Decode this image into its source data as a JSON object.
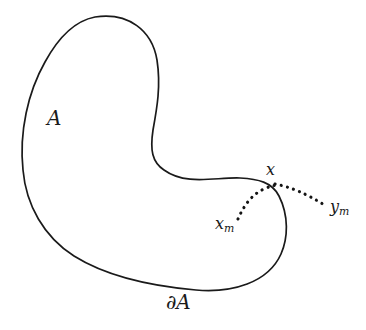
{
  "figure": {
    "type": "geometry-diagram",
    "background_color": "#ffffff",
    "stroke_color": "#1a1a1a",
    "labels": {
      "region": "A",
      "boundary_partial": "∂",
      "boundary_set": "A",
      "boundary_full": "∂A",
      "point_x": "x",
      "point_xm_base": "x",
      "point_xm_sub": "m",
      "point_ym_base": "y",
      "point_ym_sub": "m"
    },
    "caption": "",
    "elements": {
      "region_outline": "closed kidney-shaped curve",
      "dotted_arc": "curved dotted path from x_m to x",
      "dotted_ray": "straight dotted path from x to y_m"
    }
  }
}
